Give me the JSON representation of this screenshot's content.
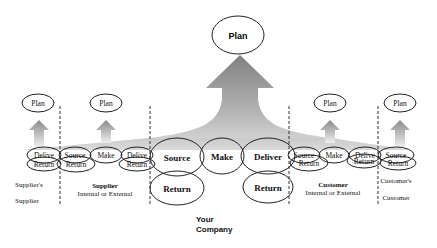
{
  "diagram": {
    "top_plan": {
      "label": "Plan"
    },
    "center": {
      "source": "Source",
      "make": "Make",
      "deliver": "Deliver",
      "return_left": "Return",
      "return_right": "Return",
      "caption_line1": "Your",
      "caption_line2": "Company"
    },
    "suppliers_supplier": {
      "plan": "Plan",
      "deliver": "Delive",
      "return": "Return",
      "caption_line1": "Supplier's",
      "caption_line2": "Supplier"
    },
    "supplier": {
      "plan": "Plan",
      "source": "Source",
      "make": "Make",
      "deliver": "Delive",
      "return_left": "Return",
      "return_right": "Return",
      "caption_line1": "Supplier",
      "caption_line2": "Internal or External"
    },
    "customer": {
      "plan": "Plan",
      "source": "Source",
      "make": "Make",
      "deliver": "Delive",
      "return_left": "Return",
      "return_right": "Return",
      "caption_line1": "Customer",
      "caption_line2": "Internal or External"
    },
    "customers_customer": {
      "plan": "Plan",
      "source": "Source",
      "return": "Return",
      "caption_line1": "Customer's",
      "caption_line2": "Customer"
    },
    "colors": {
      "arrow_dark": "#808080",
      "arrow_light": "#e6e6e6",
      "stroke": "#222222"
    }
  }
}
